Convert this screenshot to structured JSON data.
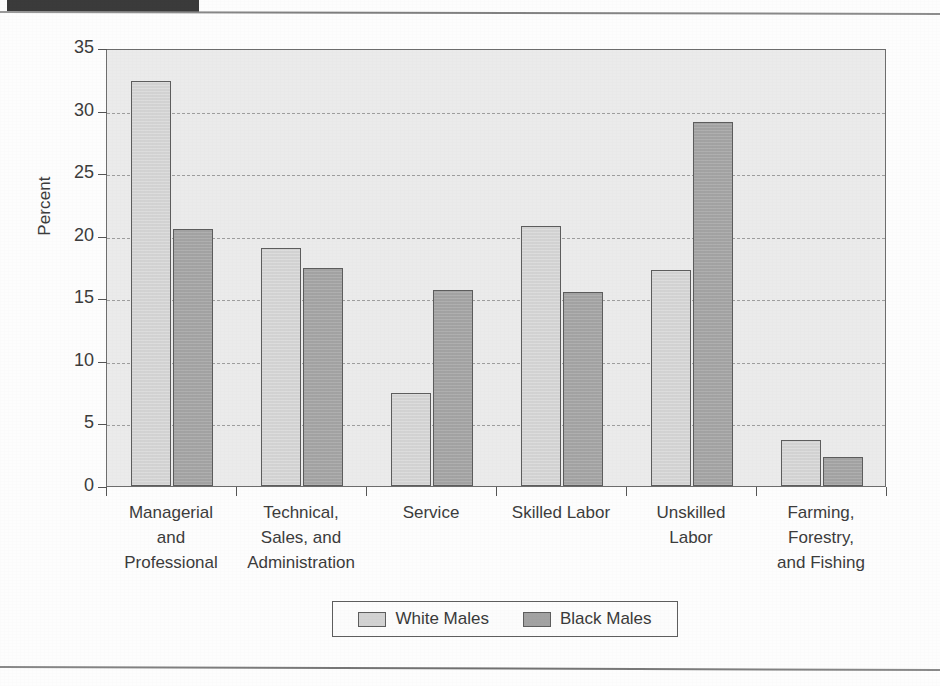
{
  "figure": {
    "header_tab_color": "#3b3b3b",
    "plot_background": "#ebebeb"
  },
  "legend": {
    "position": "bottom-center",
    "entries": [
      {
        "label": "White Males",
        "color": "#d2d2d2"
      },
      {
        "label": "Black Males",
        "color": "#a2a2a2"
      }
    ]
  },
  "chart_data": {
    "type": "bar",
    "title": "",
    "subtitle": "",
    "xlabel": "",
    "ylabel": "Percent",
    "ylim": [
      0,
      35
    ],
    "ytick_step": 5,
    "yticks": [
      0,
      5,
      10,
      15,
      20,
      25,
      30,
      35
    ],
    "ytick_labels": [
      "0",
      "5",
      "10",
      "15",
      "20",
      "25",
      "30",
      "35"
    ],
    "grid": true,
    "grid_axis": "y",
    "grid_style": "dashed",
    "legend_position": "bottom-center",
    "categories": [
      "Managerial and Professional",
      "Technical, Sales, and Administration",
      "Service",
      "Skilled Labor",
      "Unskilled Labor",
      "Farming, Forestry, and Fishing"
    ],
    "category_label_lines": [
      [
        "Managerial",
        "and",
        "Professional"
      ],
      [
        "Technical,",
        "Sales, and",
        "Administration"
      ],
      [
        "Service"
      ],
      [
        "Skilled Labor"
      ],
      [
        "Unskilled",
        "Labor"
      ],
      [
        "Farming,",
        "Forestry,",
        "and Fishing"
      ]
    ],
    "series": [
      {
        "name": "White Males",
        "color": "#d2d2d2",
        "values": [
          32.4,
          19.0,
          7.4,
          20.8,
          17.3,
          3.7
        ]
      },
      {
        "name": "Black Males",
        "color": "#a2a2a2",
        "values": [
          20.5,
          17.4,
          15.7,
          15.5,
          29.1,
          2.3
        ]
      }
    ]
  }
}
